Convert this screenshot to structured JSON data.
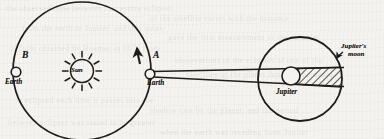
{
  "figure": {
    "kind": "astronomy-diagram",
    "background_color": "#f4f3f0",
    "ink_color": "#1d1d1b"
  },
  "labels": {
    "sun": "Sun",
    "earth_position_a": "A",
    "earth_at_a": "Earth",
    "earth_position_b": "B",
    "earth_at_b": "Earth",
    "jupiter": "Jupiter",
    "jupiters_moon_line1": "Jupiter's",
    "jupiters_moon_line2": "moon"
  },
  "geometry": {
    "earth_orbit": {
      "cx": 82,
      "cy": 71,
      "r": 69
    },
    "sun": {
      "cx": 82,
      "cy": 71,
      "r": 12,
      "ray_count": 12,
      "ray_length": 6
    },
    "earth_a": {
      "cx": 150,
      "cy": 74,
      "r": 5
    },
    "earth_b": {
      "cx": 16,
      "cy": 72,
      "r": 5
    },
    "orbit_direction_arrow": {
      "x": 136,
      "y": 52,
      "points": "counterclockwise"
    },
    "moon_orbit": {
      "cx": 300,
      "cy": 79,
      "r": 42
    },
    "jupiter": {
      "cx": 291,
      "cy": 76,
      "r": 9
    },
    "shadow_band": {
      "from_x": 300,
      "to_x": 343,
      "top_y": 67,
      "bottom_y": 86,
      "hatch_angle_deg": 45
    },
    "sight_line_upper": {
      "x1": 150,
      "y1": 72,
      "x2": 343,
      "y2": 68
    },
    "sight_line_lower": {
      "x1": 150,
      "y1": 76,
      "x2": 343,
      "y2": 86
    },
    "moon_pointer_arrow": {
      "x": 337,
      "y": 57
    }
  },
  "ghost_text": [
    {
      "text": "the observed time between successive eclipses",
      "x": 6,
      "y": 4
    },
    {
      "text": "of the satellite varies with the distance",
      "x": 150,
      "y": 14
    },
    {
      "text": "from the earth to Jupiter, and this delay",
      "x": 22,
      "y": 24
    },
    {
      "text": "gave the first measurement of the velocity",
      "x": 168,
      "y": 33
    },
    {
      "text": "of light obtained by Roemer in 1676 from",
      "x": 10,
      "y": 44
    },
    {
      "text": "observations of the eclipses of one of the",
      "x": 175,
      "y": 56
    },
    {
      "text": "satellites of the planet Jupiter. The moon",
      "x": 186,
      "y": 70
    },
    {
      "text": "is eclipsed each time it passes into the",
      "x": 16,
      "y": 96
    },
    {
      "text": "shadow cast by the planet, and the period",
      "x": 150,
      "y": 106
    },
    {
      "text": "between eclipses was found to be greater",
      "x": 8,
      "y": 118
    },
    {
      "text": "when the earth was receding from Jupiter",
      "x": 160,
      "y": 128
    }
  ]
}
